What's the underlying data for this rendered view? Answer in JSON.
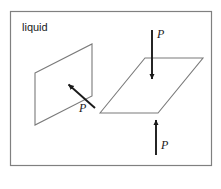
{
  "figure": {
    "title_label": "liquid",
    "container": {
      "border_color": "#808080",
      "background_color": "#ffffff",
      "x": 10,
      "y": 11,
      "width": 202,
      "height": 155
    },
    "surfaces": [
      {
        "name": "vertical-surface",
        "orientation": "vertical",
        "stroke_color": "#7a7a7a",
        "points": "35,73 92,44 92,96 35,125"
      },
      {
        "name": "horizontal-surface",
        "orientation": "horizontal",
        "stroke_color": "#7a7a7a",
        "points": "100,113 145,58 203,58 158,113"
      }
    ],
    "forces": [
      {
        "name": "pressure-force-normal-vertical",
        "label": "P",
        "direction": "up-left",
        "color": "#1a1a1a",
        "x1": 95,
        "y1": 108,
        "x2": 66,
        "y2": 82,
        "label_x": 84,
        "label_y": 110
      },
      {
        "name": "pressure-force-downward",
        "label": "P",
        "direction": "down",
        "color": "#1a1a1a",
        "x1": 152,
        "y1": 30,
        "x2": 152,
        "y2": 82,
        "label_x": 157,
        "label_y": 38
      },
      {
        "name": "pressure-force-upward",
        "label": "P",
        "direction": "up",
        "color": "#1a1a1a",
        "x1": 156,
        "y1": 155,
        "x2": 156,
        "y2": 117,
        "label_x": 161,
        "label_y": 148
      }
    ]
  }
}
